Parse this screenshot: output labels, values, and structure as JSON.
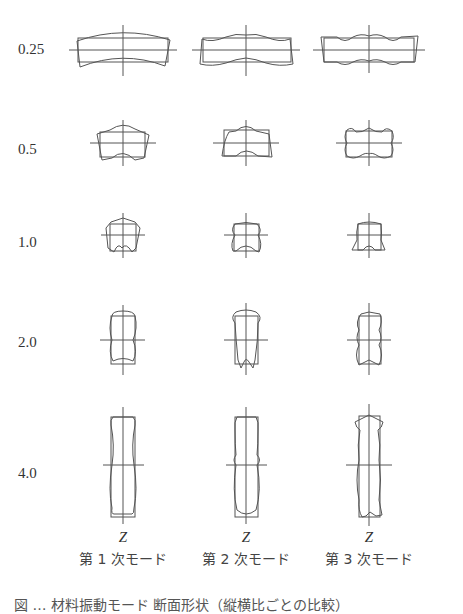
{
  "figure": {
    "row_labels": [
      "0.25",
      "0.5",
      "1.0",
      "2.0",
      "4.0"
    ],
    "axis_label": "Z",
    "column_labels": [
      "第 1 次モード",
      "第 2 次モード",
      "第 3 次モード"
    ],
    "caption_partial": "図 … 材料振動モード 断面形状（縦横比ごとの比較）"
  },
  "style": {
    "line_color": "#555555",
    "background": "#ffffff"
  }
}
